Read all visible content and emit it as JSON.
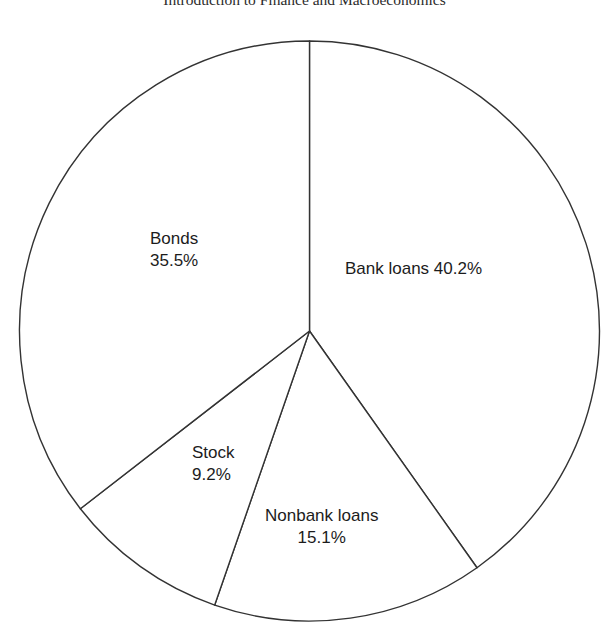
{
  "page": {
    "title": "Introduction to Finance and Macroeconomics",
    "background_color": "#ffffff"
  },
  "chart_data": {
    "type": "pie",
    "title": "Introduction to Finance and Macroeconomics",
    "xlabel": "",
    "ylabel": "",
    "legend_position": "none",
    "grid": false,
    "labels_on_slices": true,
    "start_angle_deg": 0,
    "direction": "clockwise",
    "stroke_color": "#333333",
    "slice_fill": "#ffffff",
    "categories": [
      "Bank loans",
      "Nonbank loans",
      "Stock",
      "Bonds"
    ],
    "values": [
      40.2,
      15.1,
      9.2,
      35.5
    ],
    "unit": "%",
    "slices": [
      {
        "name": "Bank loans",
        "value": 40.2,
        "value_text": "40.2%",
        "label_text": "Bank loans 40.2%",
        "label_layout": "inline",
        "color": "#ffffff"
      },
      {
        "name": "Nonbank loans",
        "value": 15.1,
        "value_text": "15.1%",
        "label_text": "Nonbank loans 15.1%",
        "label_layout": "stacked",
        "color": "#ffffff"
      },
      {
        "name": "Stock",
        "value": 9.2,
        "value_text": "9.2%",
        "label_text": "Stock 9.2%",
        "label_layout": "stacked",
        "color": "#ffffff"
      },
      {
        "name": "Bonds",
        "value": 35.5,
        "value_text": "35.5%",
        "label_text": "Bonds 35.5%",
        "label_layout": "stacked",
        "color": "#ffffff"
      }
    ]
  }
}
